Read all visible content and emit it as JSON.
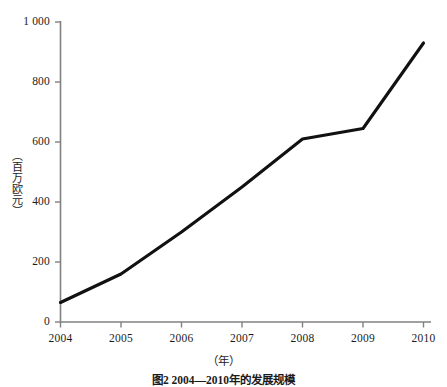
{
  "chart_data": {
    "type": "line",
    "title": "",
    "xlabel": "（年）",
    "ylabel": "（百万欧元）",
    "categories": [
      "2004",
      "2005",
      "2006",
      "2007",
      "2008",
      "2009",
      "2010"
    ],
    "x": [
      2004,
      2005,
      2006,
      2007,
      2008,
      2009,
      2010
    ],
    "values": [
      65,
      160,
      300,
      450,
      610,
      645,
      930
    ],
    "series": [
      {
        "name": "",
        "values": [
          65,
          160,
          300,
          450,
          610,
          645,
          930
        ]
      }
    ],
    "xlim": [
      2004,
      2010
    ],
    "ylim": [
      0,
      1000
    ],
    "ytick_labels": [
      "0",
      "200",
      "400",
      "600",
      "800",
      "1 000"
    ],
    "ytick_values": [
      0,
      200,
      400,
      600,
      800,
      1000
    ],
    "xtick_labels": [
      "2004",
      "2005",
      "2006",
      "2007",
      "2008",
      "2009",
      "2010"
    ],
    "grid": false,
    "legend": "none",
    "line_color": "#111111",
    "axis_color": "#808080"
  },
  "axes": {
    "y_title": "（百万欧元）",
    "x_title": "（年）"
  },
  "caption": {
    "text": "图2 2004—2010年的发展规模"
  }
}
